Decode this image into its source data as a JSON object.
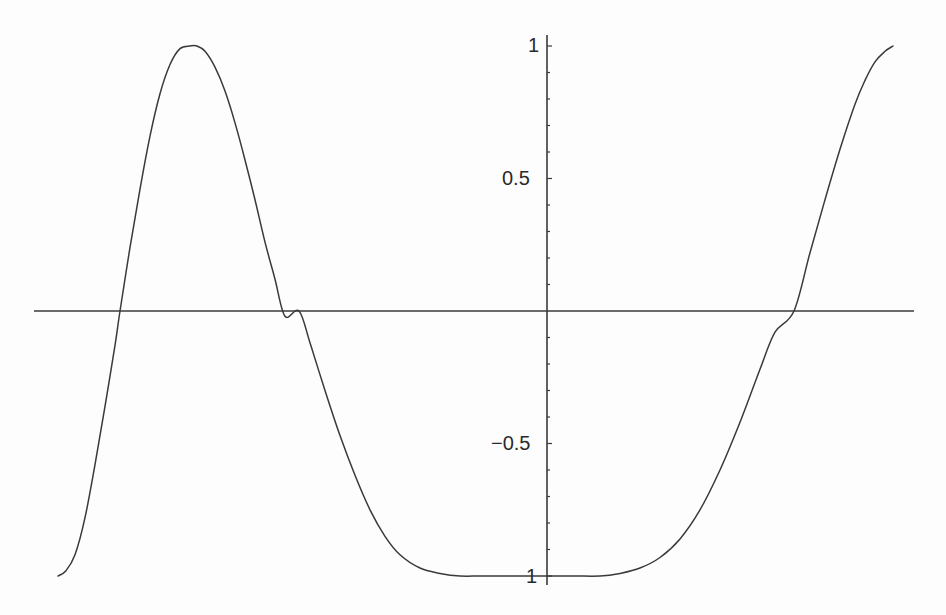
{
  "colors": {
    "background": "#fdfdfd",
    "axis": "#3a3a3a",
    "curve": "#3a3a3a",
    "text": "#2a2a2a"
  },
  "chart_data": {
    "type": "line",
    "title": "",
    "xlabel": "",
    "ylabel": "",
    "ylim": [
      -1,
      1
    ],
    "grid": false,
    "legend": null,
    "y_ticks": [
      {
        "value": 1,
        "label": "1"
      },
      {
        "value": 0.5,
        "label": "0.5"
      },
      {
        "value": -0.5,
        "label": "−0.5"
      },
      {
        "value": -1,
        "label": "1"
      }
    ],
    "y_minor_tick_step": 0.1,
    "x_ticks": [],
    "series": [
      {
        "name": "curve",
        "x_px": [
          58,
          66,
          75,
          85,
          95,
          105,
          115,
          120,
          130,
          140,
          150,
          160,
          170,
          180,
          190,
          197,
          205,
          215,
          225,
          235,
          245,
          255,
          265,
          275,
          285,
          299,
          310,
          325,
          340,
          355,
          370,
          385,
          400,
          420,
          440,
          460,
          480,
          500,
          520,
          547,
          575,
          600,
          620,
          640,
          660,
          680,
          700,
          720,
          740,
          760,
          775,
          794,
          810,
          825,
          840,
          855,
          865,
          875,
          885,
          893
        ],
        "y": [
          -1.0,
          -0.98,
          -0.92,
          -0.78,
          -0.58,
          -0.36,
          -0.13,
          0.0,
          0.24,
          0.46,
          0.66,
          0.82,
          0.93,
          0.99,
          1.0,
          1.0,
          0.98,
          0.92,
          0.83,
          0.71,
          0.57,
          0.42,
          0.26,
          0.12,
          -0.02,
          -0.0,
          -0.12,
          -0.3,
          -0.47,
          -0.62,
          -0.75,
          -0.85,
          -0.92,
          -0.97,
          -0.99,
          -1.0,
          -1.0,
          -1.0,
          -1.0,
          -1.0,
          -1.0,
          -1.0,
          -0.99,
          -0.97,
          -0.93,
          -0.86,
          -0.75,
          -0.6,
          -0.42,
          -0.22,
          -0.08,
          0.0,
          0.22,
          0.42,
          0.61,
          0.78,
          0.87,
          0.94,
          0.98,
          1.0
        ]
      }
    ],
    "x_zero_crossings_px": [
      120,
      299,
      794
    ],
    "extrema": [
      {
        "x_px": 58,
        "y": -1
      },
      {
        "x_px": 197,
        "y": 1
      },
      {
        "x_px": 547,
        "y": -1
      },
      {
        "x_px": 893,
        "y": 1
      }
    ]
  },
  "layout": {
    "origin_px": [
      547,
      311
    ],
    "px_per_unit_y": 265,
    "x_axis_px": [
      34,
      914
    ],
    "y_axis_px": [
      35,
      585
    ]
  }
}
